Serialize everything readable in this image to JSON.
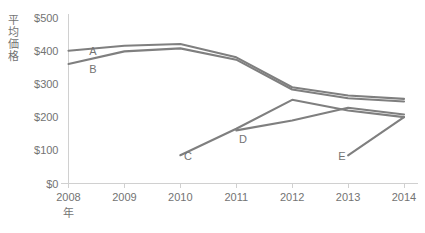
{
  "chart_data": {
    "type": "line",
    "title": "",
    "xlabel": "年",
    "ylabel": "平均価格",
    "x": [
      2008,
      2009,
      2010,
      2011,
      2012,
      2013,
      2014
    ],
    "categories": [
      "2008",
      "2009",
      "2010",
      "2011",
      "2012",
      "2013",
      "2014"
    ],
    "ylim": [
      0,
      500
    ],
    "yticks": [
      0,
      100,
      200,
      300,
      400,
      500
    ],
    "ytick_labels": [
      "$0",
      "$100",
      "$200",
      "$300",
      "$400",
      "$500"
    ],
    "grid": false,
    "legend_position": "inline-labels",
    "line_color": "#7f7f7f",
    "series": [
      {
        "name": "A",
        "label": "A",
        "color": "#7f7f7f",
        "x": [
          2008,
          2009,
          2010,
          2011,
          2012,
          2013,
          2014
        ],
        "values": [
          400,
          415,
          420,
          380,
          290,
          265,
          255
        ]
      },
      {
        "name": "B",
        "label": "B",
        "color": "#7f7f7f",
        "x": [
          2008,
          2009,
          2010,
          2011,
          2012,
          2013,
          2014
        ],
        "values": [
          360,
          398,
          407,
          373,
          283,
          257,
          247
        ]
      },
      {
        "name": "C",
        "label": "C",
        "color": "#7f7f7f",
        "x": [
          2010,
          2011,
          2012,
          2013,
          2014
        ],
        "values": [
          85,
          165,
          252,
          220,
          200
        ]
      },
      {
        "name": "D",
        "label": "D",
        "color": "#7f7f7f",
        "x": [
          2011,
          2012,
          2013,
          2014
        ],
        "values": [
          160,
          190,
          228,
          208
        ]
      },
      {
        "name": "E",
        "label": "E",
        "color": "#7f7f7f",
        "x": [
          2013,
          2014
        ],
        "values": [
          85,
          200
        ]
      }
    ],
    "series_label_anchors": [
      {
        "name": "A",
        "x": 93,
        "y": 55
      },
      {
        "name": "B",
        "x": 93,
        "y": 73
      },
      {
        "name": "C",
        "x": 188,
        "y": 160
      },
      {
        "name": "D",
        "x": 243,
        "y": 143
      },
      {
        "name": "E",
        "x": 342,
        "y": 160
      }
    ]
  },
  "axis": {
    "y_title": "平均価格",
    "y_title_chars": [
      "平",
      "均",
      "価",
      "格"
    ],
    "x_title": "年"
  }
}
